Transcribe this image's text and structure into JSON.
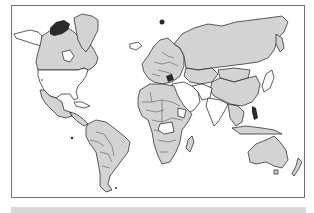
{
  "map": {
    "type": "choropleth world map",
    "projection": "mercator",
    "colors": {
      "shaded": "#d3d3d3",
      "unshaded": "#ffffff",
      "outline": "#1a1a1a",
      "frame": "#6e6e6e",
      "footer_bar": "#d9d9d9"
    },
    "regions": [
      {
        "name": "Alaska",
        "shaded": false
      },
      {
        "name": "Canada",
        "shaded": true
      },
      {
        "name": "Greenland",
        "shaded": true
      },
      {
        "name": "United States",
        "shaded": false
      },
      {
        "name": "Mexico",
        "shaded": true
      },
      {
        "name": "Cuba",
        "shaded": false
      },
      {
        "name": "Central America",
        "shaded": true
      },
      {
        "name": "South America",
        "shaded": true
      },
      {
        "name": "Iceland",
        "shaded": false
      },
      {
        "name": "Europe",
        "shaded": true
      },
      {
        "name": "Russia",
        "shaded": true
      },
      {
        "name": "Kazakhstan",
        "shaded": true
      },
      {
        "name": "Mongolia",
        "shaded": true
      },
      {
        "name": "China",
        "shaded": true
      },
      {
        "name": "Middle East",
        "shaded": false
      },
      {
        "name": "Iran",
        "shaded": false
      },
      {
        "name": "India",
        "shaded": false
      },
      {
        "name": "Southeast Asia",
        "shaded": true
      },
      {
        "name": "North Africa",
        "shaded": true
      },
      {
        "name": "Central/Southern Africa",
        "shaded": true
      },
      {
        "name": "Madagascar",
        "shaded": true
      },
      {
        "name": "Japan",
        "shaded": false
      },
      {
        "name": "Indonesia",
        "shaded": true
      },
      {
        "name": "Australia",
        "shaded": true
      },
      {
        "name": "New Zealand",
        "shaded": true
      }
    ]
  }
}
